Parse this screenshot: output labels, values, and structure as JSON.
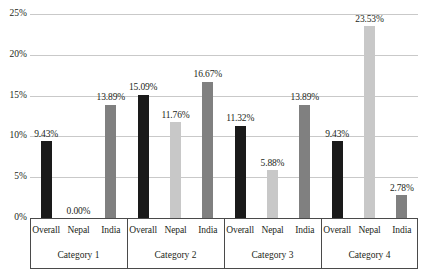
{
  "chart_data": {
    "type": "bar",
    "title": "",
    "subtitle": "",
    "xlabel": "",
    "ylabel": "",
    "ylim": [
      0,
      25
    ],
    "ytick_labels": [
      "0%",
      "5%",
      "10%",
      "15%",
      "20%",
      "25%"
    ],
    "ytick_values": [
      0,
      5,
      10,
      15,
      20,
      25
    ],
    "grid": true,
    "legend": "none",
    "categories": [
      "Category 1",
      "Category 2",
      "Category 3",
      "Category 4"
    ],
    "series": [
      {
        "name": "Overall",
        "color": "#1a1a1a",
        "values": [
          9.43,
          15.09,
          11.32,
          9.43
        ],
        "labels": [
          "9.43%",
          "15.09%",
          "11.32%",
          "9.43%"
        ]
      },
      {
        "name": "Nepal",
        "color": "#c8c8c8",
        "values": [
          0.0,
          11.76,
          5.88,
          23.53
        ],
        "labels": [
          "0.00%",
          "11.76%",
          "5.88%",
          "23.53%"
        ]
      },
      {
        "name": "India",
        "color": "#808080",
        "values": [
          13.89,
          16.67,
          13.89,
          2.78
        ],
        "labels": [
          "13.89%",
          "16.67%",
          "13.89%",
          "2.78%"
        ]
      }
    ]
  },
  "axis": {
    "series_names": [
      "Overall",
      "Nepal",
      "India"
    ],
    "category_names": [
      "Category 1",
      "Category 2",
      "Category 3",
      "Category 4"
    ]
  },
  "colors": {
    "overall": "#1a1a1a",
    "nepal": "#c8c8c8",
    "india": "#808080",
    "gridline": "#c9c9c9",
    "axis": "#4a4a4a",
    "text": "#231f20",
    "background": "#ffffff"
  }
}
